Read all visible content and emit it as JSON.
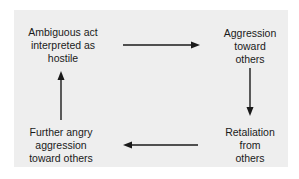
{
  "diagram": {
    "type": "cycle",
    "nodes": [
      {
        "id": "n1",
        "label_lines": [
          "Ambiguous act",
          "interpreted as",
          "hostile"
        ]
      },
      {
        "id": "n2",
        "label_lines": [
          "Aggression",
          "toward",
          "others"
        ]
      },
      {
        "id": "n3",
        "label_lines": [
          "Retaliation",
          "from",
          "others"
        ]
      },
      {
        "id": "n4",
        "label_lines": [
          "Further angry",
          "aggression",
          "toward others"
        ]
      }
    ],
    "edges": [
      {
        "from": "n1",
        "to": "n2",
        "direction": "right"
      },
      {
        "from": "n2",
        "to": "n3",
        "direction": "down"
      },
      {
        "from": "n3",
        "to": "n4",
        "direction": "left"
      },
      {
        "from": "n4",
        "to": "n1",
        "direction": "up"
      }
    ],
    "colors": {
      "panel": "#eeeeee",
      "ink": "#1a1a1a"
    }
  }
}
